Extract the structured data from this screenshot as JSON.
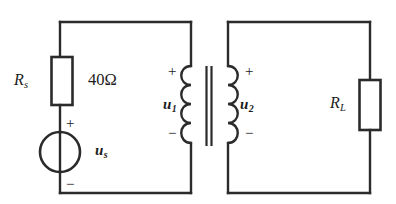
{
  "figure": {
    "background_color": "#ffffff",
    "line_color": "#2b2b2b"
  },
  "labels": {
    "source_resistor": {
      "symbol": "R",
      "subscript": "s"
    },
    "source_resistor_value": "40Ω",
    "load_resistor": {
      "symbol": "R",
      "subscript": "L"
    },
    "source_voltage": {
      "symbol": "u",
      "subscript": "s"
    },
    "primary_voltage": {
      "symbol": "u",
      "subscript": "1"
    },
    "secondary_voltage": {
      "symbol": "u",
      "subscript": "2"
    }
  },
  "polarity": {
    "plus": "+",
    "minus": "−",
    "source_plus": "+",
    "source_minus": "−",
    "primary_plus": "+",
    "primary_minus": "−",
    "secondary_plus": "+",
    "secondary_minus": "−"
  },
  "components": {
    "source_resistor": {
      "name": "Rs",
      "type": "resistor",
      "value": "40Ω",
      "orientation": "vertical"
    },
    "load_resistor": {
      "name": "RL",
      "type": "resistor",
      "orientation": "vertical"
    },
    "voltage_source": {
      "name": "us",
      "type": "ideal-voltage-source",
      "symbol": "circle-with-vertical-bar"
    },
    "transformer": {
      "type": "iron-core-transformer",
      "primary_turns_drawn": 4,
      "secondary_turns_drawn": 4,
      "core": "double-vertical-line"
    }
  }
}
